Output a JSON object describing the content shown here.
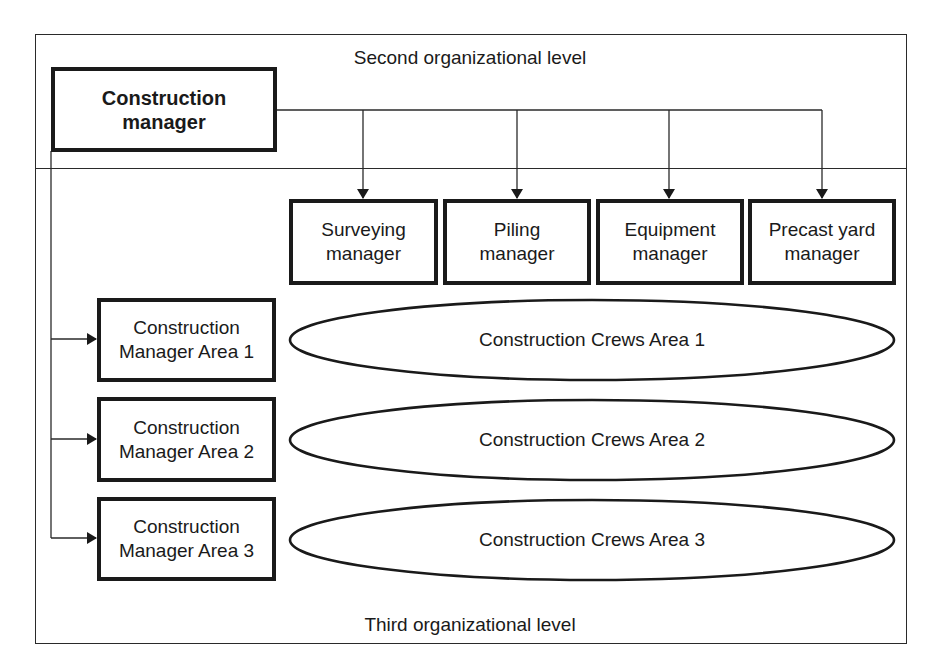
{
  "labels": {
    "second_level": "Second organizational level",
    "third_level": "Third organizational level"
  },
  "top_manager": {
    "line1": "Construction",
    "line2": "manager"
  },
  "functional_managers": [
    {
      "line1": "Surveying",
      "line2": "manager"
    },
    {
      "line1": "Piling",
      "line2": "manager"
    },
    {
      "line1": "Equipment",
      "line2": "manager"
    },
    {
      "line1": "Precast yard",
      "line2": "manager"
    }
  ],
  "area_managers": [
    {
      "line1": "Construction",
      "line2": "Manager Area 1"
    },
    {
      "line1": "Construction",
      "line2": "Manager Area 2"
    },
    {
      "line1": "Construction",
      "line2": "Manager Area 3"
    }
  ],
  "crews": [
    {
      "label": "Construction Crews Area 1"
    },
    {
      "label": "Construction Crews Area 2"
    },
    {
      "label": "Construction Crews Area 3"
    }
  ],
  "colors": {
    "stroke": "#1a1a1a",
    "background": "#ffffff"
  }
}
